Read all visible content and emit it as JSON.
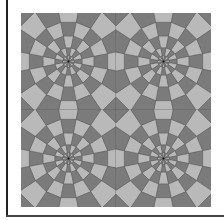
{
  "image": {
    "description": "Tiled octagonal spider-web pattern, 2x2 tiles",
    "tiles": {
      "rows": 2,
      "cols": 2
    },
    "colors": {
      "dark": "#7b7b7b",
      "light": "#b9b9b9",
      "line": "#555555",
      "frame": "#222222"
    }
  }
}
